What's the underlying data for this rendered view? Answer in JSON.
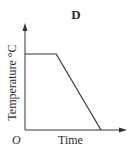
{
  "chart_data": {
    "type": "line",
    "title": "D",
    "xlabel": "Time",
    "ylabel": "Temperature °C",
    "origin_label": "O",
    "grid": false,
    "legend": null,
    "series": [
      {
        "name": "temperature",
        "x": [
          0,
          0.41,
          1.0
        ],
        "y": [
          1.0,
          1.0,
          0.0
        ]
      }
    ]
  }
}
